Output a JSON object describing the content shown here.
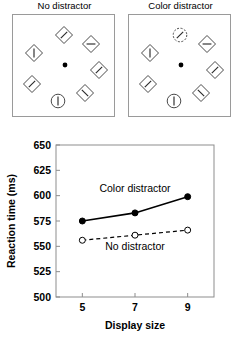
{
  "figure": {
    "panels": [
      {
        "id": "no-distractor",
        "title": "No distractor",
        "items": [
          {
            "shape": "diamond",
            "line": "diagonal-right",
            "cx": 51,
            "cy": 20,
            "dashed": false
          },
          {
            "shape": "diamond",
            "line": "horizontal",
            "cx": 78,
            "cy": 29,
            "dashed": false
          },
          {
            "shape": "diamond",
            "line": "diagonal-right",
            "cx": 86,
            "cy": 55,
            "dashed": false
          },
          {
            "shape": "diamond",
            "line": "diagonal-left",
            "cx": 72,
            "cy": 78,
            "dashed": false
          },
          {
            "shape": "circle",
            "line": "vertical",
            "cx": 45,
            "cy": 86,
            "dashed": false
          },
          {
            "shape": "diamond",
            "line": "diagonal-right",
            "cx": 19,
            "cy": 69,
            "dashed": false
          },
          {
            "shape": "diamond",
            "line": "vertical",
            "cx": 21,
            "cy": 38,
            "dashed": false
          }
        ],
        "fixation": {
          "cx": 52,
          "cy": 50
        }
      },
      {
        "id": "color-distractor",
        "title": "Color distractor",
        "items": [
          {
            "shape": "circle",
            "line": "diagonal-right",
            "cx": 51,
            "cy": 20,
            "dashed": true
          },
          {
            "shape": "diamond",
            "line": "horizontal",
            "cx": 78,
            "cy": 29,
            "dashed": false
          },
          {
            "shape": "diamond",
            "line": "diagonal-right",
            "cx": 86,
            "cy": 55,
            "dashed": false
          },
          {
            "shape": "diamond",
            "line": "diagonal-left",
            "cx": 72,
            "cy": 78,
            "dashed": false
          },
          {
            "shape": "circle",
            "line": "vertical",
            "cx": 45,
            "cy": 86,
            "dashed": false
          },
          {
            "shape": "diamond",
            "line": "diagonal-right",
            "cx": 19,
            "cy": 69,
            "dashed": false
          },
          {
            "shape": "diamond",
            "line": "vertical",
            "cx": 21,
            "cy": 38,
            "dashed": false
          }
        ],
        "fixation": {
          "cx": 52,
          "cy": 50
        }
      }
    ]
  },
  "chart_data": {
    "type": "line",
    "title": "",
    "xlabel": "Display size",
    "ylabel": "Reaction time (ms)",
    "x": [
      5,
      7,
      9
    ],
    "xticklabels": [
      "5",
      "7",
      "9"
    ],
    "xlim": [
      4,
      10
    ],
    "ylim": [
      500,
      650
    ],
    "yticks": [
      500,
      525,
      550,
      575,
      600,
      625,
      650
    ],
    "yticklabels": [
      "500",
      "525",
      "550",
      "575",
      "600",
      "625",
      "650"
    ],
    "grid": false,
    "legend_position": "inline-annotations",
    "series": [
      {
        "name": "Color distractor",
        "values": [
          575,
          583,
          599
        ],
        "linestyle": "solid",
        "marker": "filled-circle",
        "color": "#000000",
        "label_x": 7.0,
        "label_y": 604
      },
      {
        "name": "No distractor",
        "values": [
          556,
          561,
          566
        ],
        "linestyle": "dashed",
        "marker": "open-circle",
        "color": "#000000",
        "label_x": 7.0,
        "label_y": 546
      }
    ]
  }
}
